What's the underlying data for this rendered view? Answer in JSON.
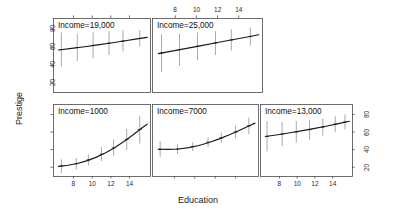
{
  "figure": {
    "kind": "effect-display-conditioning-plot",
    "background": "#ffffff",
    "line_color": "#1a1a1a",
    "errorbar_color": "#8c8c8c",
    "frame_color": "#4a4a4a",
    "axis_titles": {
      "x": "Education",
      "y": "Prestige"
    }
  },
  "chart_data": {
    "type": "line",
    "title": "",
    "subtitle": "",
    "xlabel": "Education",
    "ylabel": "Prestige",
    "xlim": [
      5.8,
      16.2
    ],
    "ylim": [
      10,
      92
    ],
    "xticks": [
      8,
      10,
      12,
      14
    ],
    "yticks": [
      20,
      40,
      60,
      80
    ],
    "grid": false,
    "legend": "none",
    "layout": {
      "rows": 2,
      "cols": 3,
      "top_row_panels": 2,
      "bottom_row_panels": 3
    },
    "conditioning_variable": "Income",
    "panels": [
      {
        "row": 1,
        "col": 1,
        "label": "Income=19,000",
        "income": 19000,
        "x_axis": "top",
        "y_axis": "left",
        "x_tick_labels_shown": false,
        "y_tick_labels_shown": true,
        "x": [
          6.4,
          7.8,
          9.2,
          10.6,
          12.0,
          13.4,
          14.8,
          15.9
        ],
        "y": [
          56.5,
          58.4,
          60.2,
          62.2,
          64.3,
          66.5,
          68.8,
          70.6
        ],
        "points": [
          {
            "x": 6.7,
            "y": 57.0,
            "lower": 38.0,
            "upper": 76.0
          },
          {
            "x": 8.4,
            "y": 59.3,
            "lower": 44.5,
            "upper": 74.5
          },
          {
            "x": 10.1,
            "y": 61.7,
            "lower": 47.5,
            "upper": 76.0
          },
          {
            "x": 11.8,
            "y": 64.1,
            "lower": 51.0,
            "upper": 77.5
          },
          {
            "x": 13.3,
            "y": 66.5,
            "lower": 55.0,
            "upper": 78.5
          },
          {
            "x": 15.1,
            "y": 69.3,
            "lower": 60.5,
            "upper": 78.5
          }
        ]
      },
      {
        "row": 1,
        "col": 2,
        "label": "Income=25,000",
        "income": 25000,
        "x_axis": "top",
        "y_axis": "none",
        "x_tick_labels_shown": true,
        "y_tick_labels_shown": false,
        "x": [
          6.4,
          7.8,
          9.2,
          10.6,
          12.0,
          13.4,
          14.8,
          15.9
        ],
        "y": [
          52.5,
          55.6,
          58.6,
          61.7,
          64.8,
          67.9,
          71.0,
          73.4
        ],
        "points": [
          {
            "x": 6.7,
            "y": 53.2,
            "lower": 32.0,
            "upper": 74.0
          },
          {
            "x": 8.4,
            "y": 57.0,
            "lower": 39.0,
            "upper": 74.5
          },
          {
            "x": 10.1,
            "y": 60.7,
            "lower": 45.0,
            "upper": 76.0
          },
          {
            "x": 11.8,
            "y": 64.4,
            "lower": 51.0,
            "upper": 77.5
          },
          {
            "x": 13.3,
            "y": 67.7,
            "lower": 56.0,
            "upper": 79.5
          },
          {
            "x": 15.1,
            "y": 71.6,
            "lower": 61.5,
            "upper": 81.5
          }
        ]
      },
      {
        "row": 2,
        "col": 1,
        "label": "Income=1000",
        "income": 1000,
        "x_axis": "bottom",
        "y_axis": "none",
        "x_tick_labels_shown": true,
        "y_tick_labels_shown": false,
        "x": [
          6.4,
          7.4,
          8.4,
          9.4,
          10.4,
          11.4,
          12.4,
          13.4,
          14.4,
          15.4,
          15.9
        ],
        "y": [
          21.0,
          22.2,
          24.2,
          27.2,
          31.2,
          36.2,
          42.2,
          49.2,
          57.0,
          65.2,
          69.0
        ],
        "points": [
          {
            "x": 6.7,
            "y": 21.3,
            "lower": 13.5,
            "upper": 29.0
          },
          {
            "x": 8.3,
            "y": 24.0,
            "lower": 17.5,
            "upper": 30.5
          },
          {
            "x": 9.6,
            "y": 28.4,
            "lower": 22.0,
            "upper": 34.5
          },
          {
            "x": 11.0,
            "y": 34.8,
            "lower": 27.0,
            "upper": 43.0
          },
          {
            "x": 12.3,
            "y": 42.0,
            "lower": 33.0,
            "upper": 51.5
          },
          {
            "x": 13.7,
            "y": 51.5,
            "lower": 39.5,
            "upper": 63.5
          },
          {
            "x": 15.1,
            "y": 63.0,
            "lower": 47.0,
            "upper": 78.5
          }
        ]
      },
      {
        "row": 2,
        "col": 2,
        "label": "Income=7000",
        "income": 7000,
        "x_axis": "bottom",
        "y_axis": "none",
        "x_tick_labels_shown": false,
        "y_tick_labels_shown": false,
        "x": [
          6.4,
          7.4,
          8.4,
          9.4,
          10.4,
          11.4,
          12.4,
          13.4,
          14.4,
          15.4,
          15.9
        ],
        "y": [
          40.5,
          40.3,
          40.8,
          42.3,
          44.8,
          48.2,
          52.3,
          57.0,
          62.2,
          67.6,
          70.2
        ],
        "points": [
          {
            "x": 6.6,
            "y": 40.5,
            "lower": 32.0,
            "upper": 49.5
          },
          {
            "x": 8.3,
            "y": 40.7,
            "lower": 35.0,
            "upper": 46.5
          },
          {
            "x": 9.8,
            "y": 43.5,
            "lower": 38.5,
            "upper": 48.5
          },
          {
            "x": 11.3,
            "y": 48.5,
            "lower": 43.0,
            "upper": 54.0
          },
          {
            "x": 12.6,
            "y": 53.5,
            "lower": 47.5,
            "upper": 59.5
          },
          {
            "x": 14.0,
            "y": 60.0,
            "lower": 52.5,
            "upper": 67.5
          },
          {
            "x": 15.3,
            "y": 67.0,
            "lower": 57.5,
            "upper": 76.5
          }
        ]
      },
      {
        "row": 2,
        "col": 3,
        "label": "Income=13,000",
        "income": 13000,
        "x_axis": "bottom",
        "y_axis": "right",
        "x_tick_labels_shown": true,
        "y_tick_labels_shown": true,
        "x": [
          6.4,
          7.8,
          9.2,
          10.6,
          12.0,
          13.4,
          14.8,
          15.9
        ],
        "y": [
          55.0,
          57.0,
          59.2,
          61.6,
          64.2,
          67.0,
          70.0,
          72.4
        ],
        "points": [
          {
            "x": 6.6,
            "y": 55.2,
            "lower": 38.0,
            "upper": 72.5
          },
          {
            "x": 8.3,
            "y": 57.7,
            "lower": 44.0,
            "upper": 71.5
          },
          {
            "x": 9.9,
            "y": 60.2,
            "lower": 48.0,
            "upper": 72.5
          },
          {
            "x": 11.4,
            "y": 62.8,
            "lower": 51.5,
            "upper": 74.0
          },
          {
            "x": 12.9,
            "y": 65.8,
            "lower": 56.0,
            "upper": 75.5
          },
          {
            "x": 14.3,
            "y": 69.0,
            "lower": 60.0,
            "upper": 78.0
          },
          {
            "x": 15.4,
            "y": 71.5,
            "lower": 63.0,
            "upper": 80.0
          }
        ]
      }
    ]
  }
}
